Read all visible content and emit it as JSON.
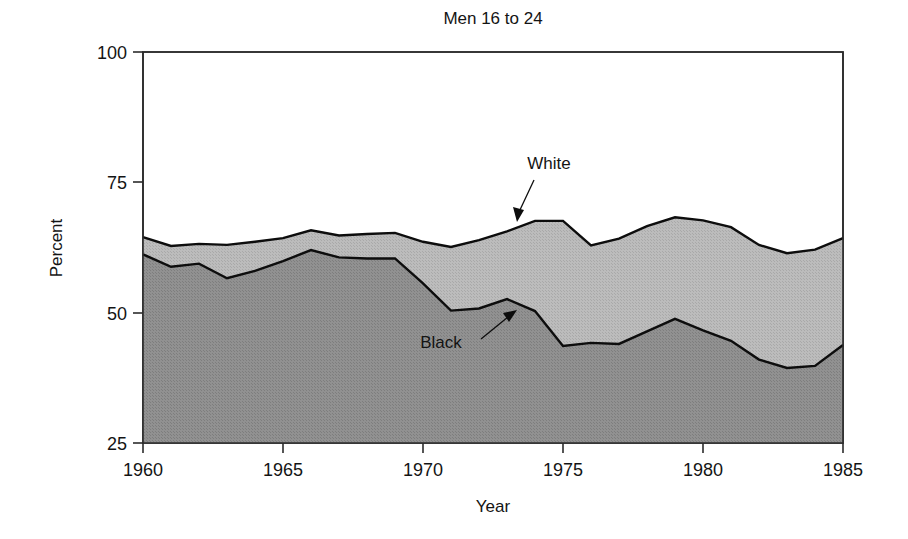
{
  "chart_data": {
    "type": "area",
    "title": "Men 16 to 24",
    "xlabel": "Year",
    "ylabel": "Percent",
    "xlim": [
      1960,
      1985
    ],
    "ylim": [
      25,
      100
    ],
    "grid": false,
    "legend_position": "inline-annotation",
    "x_ticks": [
      "1960",
      "1965",
      "1970",
      "1975",
      "1980",
      "1985"
    ],
    "x_tick_values": [
      1960,
      1965,
      1970,
      1975,
      1980,
      1985
    ],
    "y_ticks": [
      "25",
      "50",
      "75",
      "100"
    ],
    "y_tick_values": [
      25,
      50,
      75,
      100
    ],
    "x": [
      1960,
      1961,
      1962,
      1963,
      1964,
      1965,
      1966,
      1967,
      1968,
      1969,
      1970,
      1971,
      1972,
      1973,
      1974,
      1975,
      1976,
      1977,
      1978,
      1979,
      1980,
      1981,
      1982,
      1983,
      1984,
      1985
    ],
    "series": [
      {
        "name": "White",
        "label": "White",
        "fill_color": "#b6b6b6",
        "line_color": "#0d0d0d",
        "values": [
          64.5,
          62.8,
          63.2,
          63.0,
          63.6,
          64.3,
          65.8,
          64.8,
          65.1,
          65.3,
          63.6,
          62.6,
          63.9,
          65.6,
          67.6,
          67.6,
          62.9,
          64.2,
          66.6,
          68.3,
          67.7,
          66.4,
          63.0,
          61.4,
          62.1,
          64.3
        ]
      },
      {
        "name": "Black",
        "label": "Black",
        "fill_color": "#8c8c8c",
        "line_color": "#0d0d0d",
        "values": [
          61.2,
          58.8,
          59.4,
          56.6,
          58.0,
          59.9,
          62.0,
          60.6,
          60.4,
          60.4,
          55.6,
          50.4,
          50.8,
          52.6,
          50.3,
          43.6,
          44.2,
          44.0,
          46.4,
          48.8,
          46.6,
          44.6,
          41.0,
          39.4,
          39.8,
          43.8
        ]
      }
    ],
    "annotations": [
      {
        "name": "white-annotation",
        "text": "White",
        "points_to_year": 1973,
        "points_to_value": 65.6
      },
      {
        "name": "black-annotation",
        "text": "Black",
        "points_to_year": 1973,
        "points_to_value": 52.6
      }
    ]
  }
}
